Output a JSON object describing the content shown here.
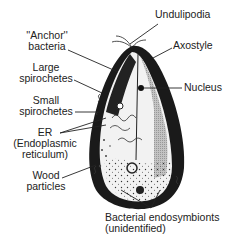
{
  "figure": {
    "labels": {
      "undulipodia": "Undulipodia",
      "axostyle": "Axostyle",
      "nucleus": "Nucleus",
      "anchor_bacteria_line1": "''Anchor''",
      "anchor_bacteria_line2": "bacteria",
      "large_spirochetes_line1": "Large",
      "large_spirochetes_line2": "spirochetes",
      "small_spirochetes_line1": "Small",
      "small_spirochetes_line2": "spirochetes",
      "er_line1": "ER",
      "er_line2": "(Endoplasmic",
      "er_line3": "reticulum)",
      "wood_particles_line1": "Wood",
      "wood_particles_line2": "particles",
      "endosymbionts_line1": "Bacterial endosymbionts",
      "endosymbionts_line2": "(unidentified)"
    },
    "colors": {
      "ink": "#111111",
      "background": "#ffffff",
      "shading": "#555555"
    }
  }
}
